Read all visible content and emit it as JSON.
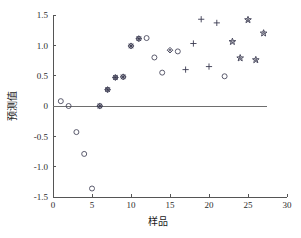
{
  "chart_data": {
    "type": "scatter",
    "title": "",
    "xlabel": "样品",
    "ylabel": "预测值",
    "xlim": [
      0,
      30
    ],
    "ylim": [
      -1.5,
      1.5
    ],
    "xticks": [
      "0",
      "5",
      "10",
      "15",
      "20",
      "25",
      "30"
    ],
    "xtick_values": [
      0,
      5,
      10,
      15,
      20,
      25,
      30
    ],
    "yticks": [
      "1.5",
      "1.0",
      "0.5",
      "0",
      "-0.5",
      "-1.0",
      "-1.5"
    ],
    "ytick_values": [
      1.5,
      1.0,
      0.5,
      0,
      -0.5,
      -1.0,
      -1.5
    ],
    "grid": false,
    "legend": null,
    "reference_line": {
      "y": 0,
      "label": ""
    },
    "series": [
      {
        "name": "open-circle",
        "marker": "circle",
        "points": [
          {
            "x": 1,
            "y": 0.08
          },
          {
            "x": 2,
            "y": 0.0
          },
          {
            "x": 3,
            "y": -0.43
          },
          {
            "x": 4,
            "y": -0.79
          },
          {
            "x": 5,
            "y": -1.36
          },
          {
            "x": 12,
            "y": 1.12
          },
          {
            "x": 13,
            "y": 0.8
          },
          {
            "x": 14,
            "y": 0.55
          },
          {
            "x": 16,
            "y": 0.9
          },
          {
            "x": 22,
            "y": 0.49
          }
        ]
      },
      {
        "name": "asterisk",
        "marker": "asterisk",
        "points": [
          {
            "x": 6,
            "y": 0.0
          },
          {
            "x": 7,
            "y": 0.27
          },
          {
            "x": 8,
            "y": 0.47
          },
          {
            "x": 9,
            "y": 0.48
          },
          {
            "x": 10,
            "y": 0.99
          },
          {
            "x": 11,
            "y": 1.11
          }
        ]
      },
      {
        "name": "diamond",
        "marker": "diamond",
        "points": [
          {
            "x": 15,
            "y": 0.92
          }
        ]
      },
      {
        "name": "plus",
        "marker": "plus",
        "points": [
          {
            "x": 17,
            "y": 0.6
          },
          {
            "x": 18,
            "y": 1.03
          },
          {
            "x": 19,
            "y": 1.43
          },
          {
            "x": 20,
            "y": 0.65
          },
          {
            "x": 21,
            "y": 1.37
          }
        ]
      },
      {
        "name": "star",
        "marker": "star",
        "points": [
          {
            "x": 23,
            "y": 1.06
          },
          {
            "x": 24,
            "y": 0.79
          },
          {
            "x": 25,
            "y": 1.42
          },
          {
            "x": 26,
            "y": 0.76
          },
          {
            "x": 27,
            "y": 1.2
          }
        ]
      }
    ]
  },
  "colors": {
    "marker": "#3a3a50",
    "axis": "#555555",
    "zero_line": "#6e6e6e",
    "background": "#ffffff"
  }
}
